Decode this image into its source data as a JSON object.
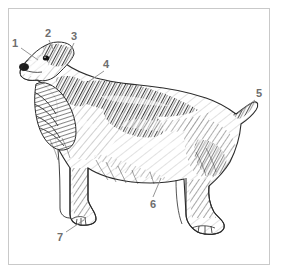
{
  "figure": {
    "style": "pen-and-ink stipple hatching engraving",
    "background_color": "#ffffff",
    "frame_color": "#c9c9c9",
    "ink_color": "#2b2b2b",
    "label_color": "#6e6e6e",
    "orientation": "dog facing left, standing in profile"
  },
  "callouts": [
    {
      "number": "1",
      "x": 12,
      "y": 38,
      "leader": {
        "x1": 21,
        "y1": 48,
        "x2": 38,
        "y2": 60
      },
      "points_to": "muzzle"
    },
    {
      "number": "2",
      "x": 45,
      "y": 28,
      "leader": {
        "x1": 49,
        "y1": 40,
        "x2": 54,
        "y2": 51
      },
      "points_to": "skull-top"
    },
    {
      "number": "3",
      "x": 71,
      "y": 31,
      "leader": {
        "x1": 74,
        "y1": 43,
        "x2": 69,
        "y2": 54
      },
      "points_to": "occiput"
    },
    {
      "number": "4",
      "x": 103,
      "y": 59,
      "leader": {
        "x1": 104,
        "y1": 71,
        "x2": 88,
        "y2": 82
      },
      "points_to": "neck-withers"
    },
    {
      "number": "5",
      "x": 256,
      "y": 88,
      "leader": {
        "x1": 255,
        "y1": 100,
        "x2": 238,
        "y2": 113
      },
      "points_to": "tail"
    },
    {
      "number": "6",
      "x": 150,
      "y": 199,
      "leader": {
        "x1": 153,
        "y1": 197,
        "x2": 161,
        "y2": 178
      },
      "points_to": "underline-belly"
    },
    {
      "number": "7",
      "x": 57,
      "y": 232,
      "leader": {
        "x1": 66,
        "y1": 232,
        "x2": 84,
        "y2": 220
      },
      "points_to": "front-foot"
    }
  ]
}
